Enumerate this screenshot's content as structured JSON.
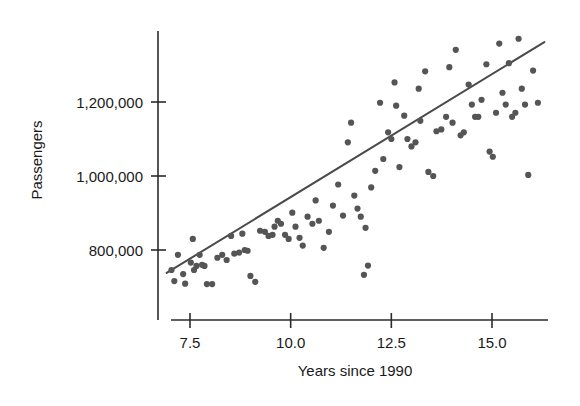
{
  "chart_data": {
    "type": "scatter",
    "title": "",
    "xlabel": "Years since 1990",
    "ylabel": "Passengers",
    "xlim": [
      6.9,
      16.4
    ],
    "ylim": [
      690000,
      1400000
    ],
    "grid": false,
    "legend": null,
    "xticks": [
      7.5,
      10.0,
      12.5,
      15.0
    ],
    "xtick_labels": [
      "7.5",
      "10.0",
      "12.5",
      "15.0"
    ],
    "yticks": [
      800000,
      1000000,
      1200000
    ],
    "ytick_labels": [
      "800,000",
      "1,000,000",
      "1,200,000"
    ],
    "marker_color": "#555555",
    "fit_line_color": "#4a4a4a",
    "fit_line": {
      "label": "least-squares regression line",
      "x_start": 6.92,
      "y_start": 738000,
      "x_end": 16.3,
      "y_end": 1362000,
      "slope": 66500,
      "intercept": 278000
    },
    "points": [
      [
        7.04,
        746000
      ],
      [
        7.11,
        716000
      ],
      [
        7.2,
        787000
      ],
      [
        7.33,
        735000
      ],
      [
        7.38,
        709000
      ],
      [
        7.52,
        766000
      ],
      [
        7.57,
        830000
      ],
      [
        7.6,
        746000
      ],
      [
        7.66,
        757000
      ],
      [
        7.74,
        787000
      ],
      [
        7.8,
        760000
      ],
      [
        7.86,
        757000
      ],
      [
        7.92,
        708000
      ],
      [
        8.05,
        708000
      ],
      [
        8.18,
        779000
      ],
      [
        8.3,
        787000
      ],
      [
        8.41,
        773000
      ],
      [
        8.52,
        838000
      ],
      [
        8.6,
        790000
      ],
      [
        8.72,
        793000
      ],
      [
        8.8,
        844000
      ],
      [
        8.86,
        800000
      ],
      [
        8.93,
        798000
      ],
      [
        9.0,
        730000
      ],
      [
        9.12,
        714000
      ],
      [
        9.24,
        852000
      ],
      [
        9.36,
        849000
      ],
      [
        9.45,
        838000
      ],
      [
        9.55,
        841000
      ],
      [
        9.6,
        863000
      ],
      [
        9.68,
        879000
      ],
      [
        9.76,
        871000
      ],
      [
        9.86,
        841000
      ],
      [
        9.95,
        830000
      ],
      [
        10.04,
        901000
      ],
      [
        10.12,
        863000
      ],
      [
        10.22,
        833000
      ],
      [
        10.3,
        812000
      ],
      [
        10.42,
        890000
      ],
      [
        10.54,
        871000
      ],
      [
        10.62,
        934000
      ],
      [
        10.7,
        879000
      ],
      [
        10.82,
        806000
      ],
      [
        10.95,
        849000
      ],
      [
        11.05,
        920000
      ],
      [
        11.18,
        977000
      ],
      [
        11.3,
        893000
      ],
      [
        11.42,
        1091000
      ],
      [
        11.5,
        1144000
      ],
      [
        11.58,
        947000
      ],
      [
        11.66,
        912000
      ],
      [
        11.74,
        890000
      ],
      [
        11.86,
        860000
      ],
      [
        11.92,
        758000
      ],
      [
        12.0,
        969000
      ],
      [
        12.1,
        1014000
      ],
      [
        12.22,
        1198000
      ],
      [
        12.3,
        1046000
      ],
      [
        12.42,
        1118000
      ],
      [
        12.5,
        1100000
      ],
      [
        12.58,
        1253000
      ],
      [
        12.7,
        1024000
      ],
      [
        12.82,
        1163000
      ],
      [
        12.9,
        1100000
      ],
      [
        13.0,
        1080000
      ],
      [
        13.1,
        1091000
      ],
      [
        13.22,
        1149000
      ],
      [
        13.34,
        1283000
      ],
      [
        13.42,
        1011000
      ],
      [
        13.54,
        1000000
      ],
      [
        13.62,
        1121000
      ],
      [
        13.74,
        1126000
      ],
      [
        13.86,
        1160000
      ],
      [
        13.94,
        1294000
      ],
      [
        14.02,
        1144000
      ],
      [
        14.1,
        1341000
      ],
      [
        14.22,
        1110000
      ],
      [
        14.3,
        1118000
      ],
      [
        14.42,
        1247000
      ],
      [
        14.5,
        1193000
      ],
      [
        14.58,
        1160000
      ],
      [
        14.66,
        1160000
      ],
      [
        14.74,
        1206000
      ],
      [
        14.86,
        1302000
      ],
      [
        14.94,
        1066000
      ],
      [
        15.02,
        1052000
      ],
      [
        15.1,
        1171000
      ],
      [
        15.18,
        1358000
      ],
      [
        15.26,
        1225000
      ],
      [
        15.34,
        1193000
      ],
      [
        15.42,
        1305000
      ],
      [
        15.5,
        1160000
      ],
      [
        15.58,
        1171000
      ],
      [
        15.66,
        1371000
      ],
      [
        15.74,
        1236000
      ],
      [
        15.82,
        1193000
      ],
      [
        15.9,
        1003000
      ],
      [
        16.02,
        1285000
      ],
      [
        16.14,
        1198000
      ],
      [
        11.82,
        733000
      ],
      [
        12.62,
        1190000
      ],
      [
        13.18,
        1236000
      ]
    ]
  }
}
